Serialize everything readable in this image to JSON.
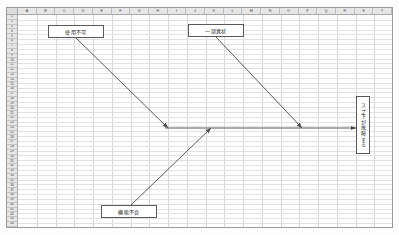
{
  "app": {
    "type": "spreadsheet-drawing-canvas",
    "sheet_background": "#ffffff",
    "grid_line_color": "#d7d7d7",
    "header_background": "#e6e6e6",
    "shape_border_color": "#595959",
    "connector_color": "#4a4a4a"
  },
  "columns": [
    "A",
    "B",
    "C",
    "D",
    "E",
    "F",
    "G",
    "H",
    "I",
    "J",
    "K",
    "L",
    "M",
    "N",
    "O",
    "P",
    "Q",
    "R",
    "S",
    "T"
  ],
  "rows": [
    "1",
    "2",
    "3",
    "4",
    "5",
    "6",
    "7",
    "8",
    "9",
    "10",
    "11",
    "12",
    "13",
    "14",
    "15",
    "16",
    "17",
    "18",
    "19",
    "20",
    "21",
    "22",
    "23",
    "24",
    "25",
    "26",
    "27",
    "28",
    "29",
    "30",
    "31",
    "32",
    "33",
    "34",
    "35",
    "36",
    "37",
    "38",
    "39",
    "40",
    "41",
    "42",
    "43",
    "44"
  ],
  "shapes": [
    {
      "id": "box-usage-not-possible",
      "name": "text-box-usage-not-possible",
      "label": "使用不可",
      "x": 48,
      "y": 25,
      "w": 56,
      "h": 13,
      "orientation": "horizontal"
    },
    {
      "id": "box-partial-abnormality",
      "name": "text-box-partial-abnormality",
      "label": "一部異状",
      "x": 188,
      "y": 24,
      "w": 56,
      "h": 13,
      "orientation": "horizontal"
    },
    {
      "id": "box-function-defect",
      "name": "text-box-function-defect",
      "label": "機能不良",
      "x": 101,
      "y": 205,
      "w": 56,
      "h": 13,
      "orientation": "horizontal"
    },
    {
      "id": "box-sprinkler-failure",
      "name": "text-box-sprinkler-failure",
      "label": "スプ下が故障する",
      "x": 356,
      "y": 96,
      "w": 14,
      "h": 58,
      "orientation": "vertical"
    }
  ],
  "connectors": [
    {
      "id": "arrow-usage-to-main",
      "name": "connector-usage-not-possible-to-main",
      "from": [
        76,
        38
      ],
      "to": [
        168,
        128
      ],
      "arrowhead": "end"
    },
    {
      "id": "arrow-partial-to-main",
      "name": "connector-partial-abnormality-to-main",
      "from": [
        216,
        37
      ],
      "to": [
        302,
        128
      ],
      "arrowhead": "end"
    },
    {
      "id": "arrow-defect-to-main",
      "name": "connector-function-defect-to-main",
      "from": [
        131,
        205
      ],
      "to": [
        211,
        128
      ],
      "arrowhead": "end"
    },
    {
      "id": "arrow-main-spine",
      "name": "connector-main-spine",
      "from": [
        165,
        128
      ],
      "to": [
        356,
        128
      ],
      "arrowhead": "end"
    }
  ]
}
